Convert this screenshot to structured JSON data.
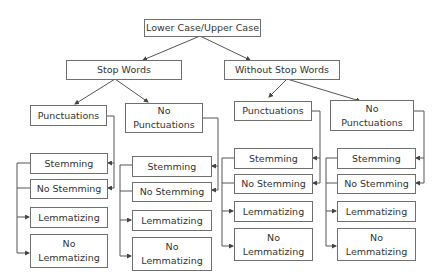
{
  "root": {
    "label": "Lower Case/Upper Case"
  },
  "level1": [
    {
      "label": "Stop Words"
    },
    {
      "label": "Without Stop Words"
    }
  ],
  "level2": [
    {
      "label": "Punctuations"
    },
    {
      "label": "No Punctuations"
    },
    {
      "label": "Punctuations"
    },
    {
      "label": "No Punctuations"
    }
  ],
  "columns": [
    {
      "items": [
        "Stemming",
        "No Stemming",
        "Lemmatizing",
        "No Lemmatizing"
      ]
    },
    {
      "items": [
        "Stemming",
        "No Stemming",
        "Lemmatizing",
        "No Lemmatizing"
      ]
    },
    {
      "items": [
        "Stemming",
        "No Stemming",
        "Lemmatizing",
        "No Lemmatizing"
      ]
    },
    {
      "items": [
        "Stemming",
        "No Stemming",
        "Lemmatizing",
        "No Lemmatizing"
      ]
    }
  ],
  "colors": {
    "line": "#555555",
    "border": "#6f6f6f",
    "text": "#333333"
  }
}
